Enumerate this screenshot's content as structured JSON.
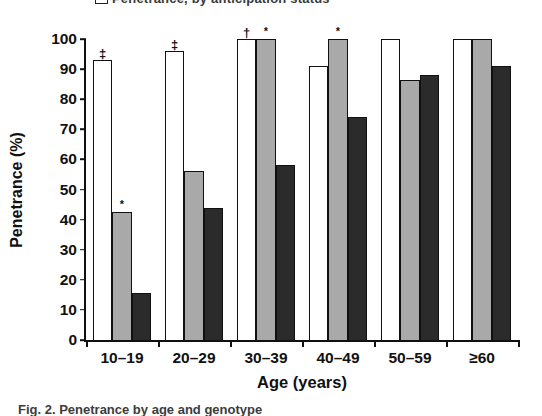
{
  "legend": {
    "clipped_text": "Penetrance, by anticipation status",
    "swatch_icon": "white-square-swatch"
  },
  "caption": {
    "clipped_text": "Fig. 2. Penetrance by age and genotype"
  },
  "axes": {
    "ylabel": "Penetrance (%)",
    "xlabel": "Age (years)",
    "yticks": [
      "0",
      "10",
      "20",
      "30",
      "40",
      "50",
      "60",
      "70",
      "80",
      "90",
      "100"
    ]
  },
  "chart_data": {
    "type": "bar",
    "title": "",
    "xlabel": "Age (years)",
    "ylabel": "Penetrance (%)",
    "ylim": [
      0,
      100
    ],
    "ytick_step": 10,
    "grid": false,
    "legend_position": "top",
    "categories": [
      "10–19",
      "20–29",
      "30–39",
      "40–49",
      "50–59",
      "≥60"
    ],
    "series": [
      {
        "name": "white",
        "fill": "#ffffff",
        "values": [
          93,
          96,
          100,
          91,
          100,
          100
        ],
        "markers": [
          "‡",
          "‡",
          "†",
          "",
          "",
          ""
        ]
      },
      {
        "name": "gray",
        "fill": "#a9a9a9",
        "values": [
          42.5,
          56,
          100,
          100,
          86.5,
          100
        ],
        "markers": [
          "*",
          "",
          "*",
          "*",
          "",
          ""
        ]
      },
      {
        "name": "dark",
        "fill": "#2b2b2b",
        "values": [
          15.5,
          44,
          58,
          74,
          88,
          91
        ],
        "markers": [
          "",
          "",
          "",
          "",
          "",
          ""
        ]
      }
    ],
    "marker_legend": {
      "star": "*",
      "dagger": "†",
      "double_dagger": "‡"
    }
  },
  "colors": {
    "axis": "#111111",
    "series_white": "#ffffff",
    "series_gray": "#a9a9a9",
    "series_dark": "#2b2b2b"
  }
}
